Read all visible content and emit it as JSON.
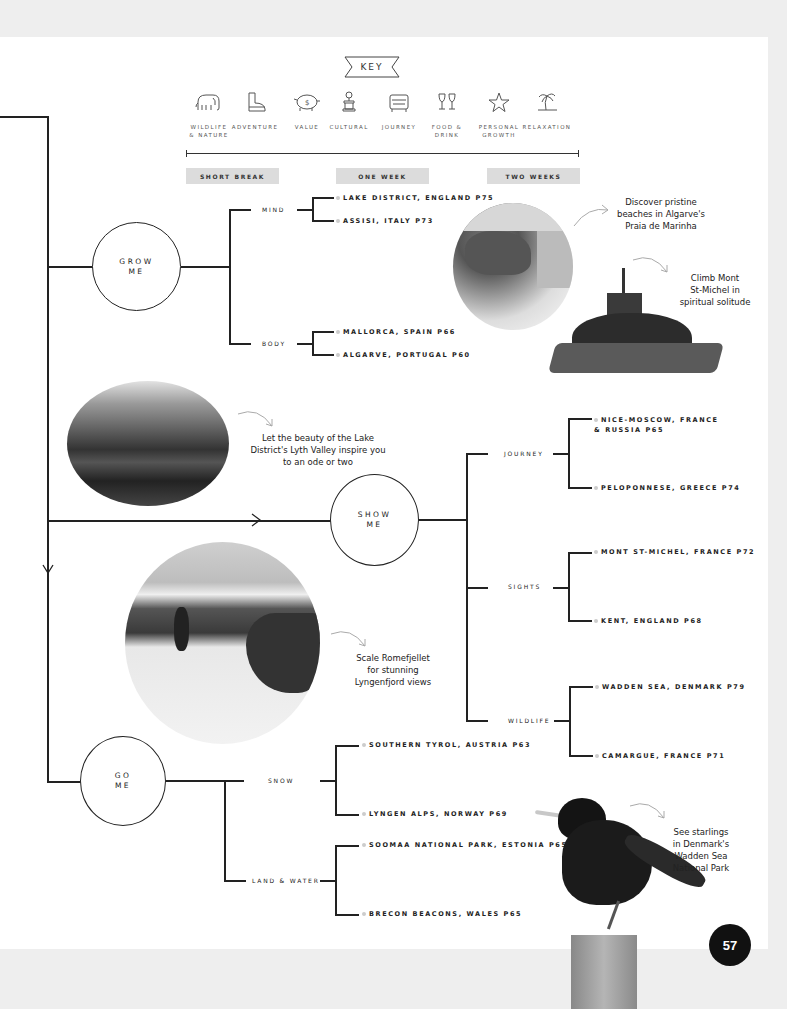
{
  "key": {
    "title": "KEY",
    "items": [
      {
        "icon": "elephant-icon",
        "label": "WILDLIFE\n& NATURE"
      },
      {
        "icon": "boot-icon",
        "label": "ADVENTURE"
      },
      {
        "icon": "piggy-bank-icon",
        "label": "VALUE"
      },
      {
        "icon": "monument-icon",
        "label": "CULTURAL"
      },
      {
        "icon": "car-icon",
        "label": "JOURNEY"
      },
      {
        "icon": "wine-glasses-icon",
        "label": "FOOD &\nDRINK"
      },
      {
        "icon": "star-icon",
        "label": "PERSONAL\nGROWTH"
      },
      {
        "icon": "palm-tree-icon",
        "label": "RELAXATION"
      }
    ]
  },
  "durations": [
    "SHORT BREAK",
    "ONE WEEK",
    "TWO WEEKS"
  ],
  "groups": {
    "grow": {
      "label": "GROW\nME",
      "categories": [
        {
          "label": "MIND",
          "destinations": [
            "LAKE DISTRICT, ENGLAND P75",
            "ASSISI, ITALY P73"
          ]
        },
        {
          "label": "BODY",
          "destinations": [
            "MALLORCA, SPAIN P66",
            "ALGARVE, PORTUGAL P60"
          ]
        }
      ]
    },
    "show": {
      "label": "SHOW\nME",
      "categories": [
        {
          "label": "JOURNEY",
          "destinations": [
            "NICE-MOSCOW, FRANCE\n& RUSSIA P65",
            "PELOPONNESE, GREECE P74"
          ]
        },
        {
          "label": "SIGHTS",
          "destinations": [
            "MONT ST-MICHEL, FRANCE P72",
            "KENT, ENGLAND P68"
          ]
        },
        {
          "label": "WILDLIFE",
          "destinations": [
            "WADDEN SEA, DENMARK P79",
            "CAMARGUE, FRANCE P71"
          ]
        }
      ]
    },
    "go": {
      "label": "GO\nME",
      "categories": [
        {
          "label": "SNOW",
          "destinations": [
            "SOUTHERN TYROL, AUSTRIA P63",
            "LYNGEN ALPS, NORWAY P69"
          ]
        },
        {
          "label": "LAND & WATER",
          "destinations": [
            "SOOMAA NATIONAL PARK, ESTONIA P65",
            "BRECON BEACONS, WALES P65"
          ]
        }
      ]
    }
  },
  "captions": {
    "algarve": "Discover pristine\nbeaches in Algarve's\nPraia de Marinha",
    "mont_st_michel": "Climb Mont\nSt-Michel in\nspiritual solitude",
    "lake_district": "Let the beauty of the Lake\nDistrict's Lyth Valley inspire you\nto an ode or two",
    "lyngen": "Scale Romefjellet\nfor stunning\nLyngenfjord views",
    "starlings": "See starlings\nin Denmark's\nWadden Sea\nNational Park"
  },
  "page_number": "57"
}
